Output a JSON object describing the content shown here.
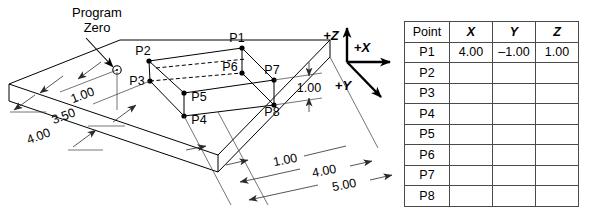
{
  "figure": {
    "note_line1": "Program",
    "note_line2": "Zero",
    "datum_symbol": "program-zero-circle"
  },
  "axes": {
    "z": "+Z",
    "x": "+X",
    "y": "+Y"
  },
  "points": {
    "p1": "P1",
    "p2": "P2",
    "p3": "P3",
    "p4": "P4",
    "p5": "P5",
    "p6": "P6",
    "p7": "P7",
    "p8": "P8"
  },
  "dimensions": {
    "left_1": "1.00",
    "left_2": "3.50",
    "left_3": "4.00",
    "right_height": "1.00",
    "bottom_1": "1.00",
    "bottom_2": "4.00",
    "bottom_3": "5.00"
  },
  "table": {
    "headers": [
      "Point",
      "X",
      "Y",
      "Z"
    ],
    "rows": [
      {
        "point": "P1",
        "x": "4.00",
        "y": "–1.00",
        "z": "1.00"
      },
      {
        "point": "P2",
        "x": "",
        "y": "",
        "z": ""
      },
      {
        "point": "P3",
        "x": "",
        "y": "",
        "z": ""
      },
      {
        "point": "P4",
        "x": "",
        "y": "",
        "z": ""
      },
      {
        "point": "P5",
        "x": "",
        "y": "",
        "z": ""
      },
      {
        "point": "P6",
        "x": "",
        "y": "",
        "z": ""
      },
      {
        "point": "P7",
        "x": "",
        "y": "",
        "z": ""
      },
      {
        "point": "P8",
        "x": "",
        "y": "",
        "z": ""
      }
    ]
  },
  "colors": {
    "line": "#000000",
    "border": "#4a4a4a",
    "background": "#ffffff"
  }
}
